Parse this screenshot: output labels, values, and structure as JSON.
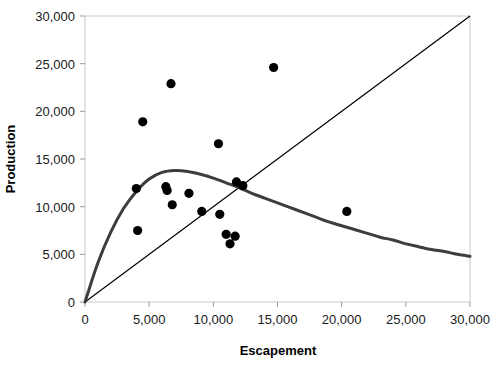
{
  "chart_data": {
    "type": "scatter",
    "title": "",
    "xlabel": "Escapement",
    "ylabel": "Production",
    "xlim": [
      0,
      30000
    ],
    "ylim": [
      0,
      30000
    ],
    "grid": false,
    "legend": "none",
    "x_ticks": [
      0,
      5000,
      10000,
      15000,
      20000,
      25000,
      30000
    ],
    "y_ticks": [
      0,
      5000,
      10000,
      15000,
      20000,
      25000,
      30000
    ],
    "x_tick_labels": [
      "0",
      "5,000",
      "10,000",
      "15,000",
      "20,000",
      "25,000",
      "30,000"
    ],
    "y_tick_labels": [
      "0",
      "5,000",
      "10,000",
      "15,000",
      "20,000",
      "25,000",
      "30,000"
    ],
    "series": [
      {
        "name": "observations",
        "type": "scatter",
        "marker": "circle",
        "color": "#000000",
        "points": [
          {
            "x": 4000,
            "y": 11900
          },
          {
            "x": 4100,
            "y": 7500
          },
          {
            "x": 4500,
            "y": 18900
          },
          {
            "x": 6300,
            "y": 12100
          },
          {
            "x": 6400,
            "y": 11700
          },
          {
            "x": 6700,
            "y": 22900
          },
          {
            "x": 6800,
            "y": 10200
          },
          {
            "x": 8100,
            "y": 11400
          },
          {
            "x": 9100,
            "y": 9500
          },
          {
            "x": 10400,
            "y": 16600
          },
          {
            "x": 10500,
            "y": 9200
          },
          {
            "x": 11000,
            "y": 7100
          },
          {
            "x": 11300,
            "y": 6100
          },
          {
            "x": 11700,
            "y": 6900
          },
          {
            "x": 11800,
            "y": 12600
          },
          {
            "x": 12300,
            "y": 12200
          },
          {
            "x": 14700,
            "y": 24600
          },
          {
            "x": 20400,
            "y": 9500
          }
        ]
      },
      {
        "name": "production-curve",
        "type": "line",
        "color": "#3d3d3d",
        "width": 3,
        "description": "Ricker stock-recruitment curve, peak 13,800 at escapement 7,000",
        "points": [
          {
            "x": 0,
            "y": 0
          },
          {
            "x": 1000,
            "y": 4100
          },
          {
            "x": 2000,
            "y": 7300
          },
          {
            "x": 3000,
            "y": 9800
          },
          {
            "x": 4000,
            "y": 11600
          },
          {
            "x": 5000,
            "y": 12900
          },
          {
            "x": 6000,
            "y": 13600
          },
          {
            "x": 7000,
            "y": 13800
          },
          {
            "x": 8000,
            "y": 13700
          },
          {
            "x": 9000,
            "y": 13400
          },
          {
            "x": 10000,
            "y": 13000
          },
          {
            "x": 11000,
            "y": 12500
          },
          {
            "x": 12000,
            "y": 12000
          },
          {
            "x": 13000,
            "y": 11400
          },
          {
            "x": 14000,
            "y": 10900
          },
          {
            "x": 15000,
            "y": 10400
          },
          {
            "x": 16000,
            "y": 9900
          },
          {
            "x": 17000,
            "y": 9400
          },
          {
            "x": 18000,
            "y": 8900
          },
          {
            "x": 19000,
            "y": 8400
          },
          {
            "x": 20000,
            "y": 8000
          },
          {
            "x": 21000,
            "y": 7600
          },
          {
            "x": 22000,
            "y": 7200
          },
          {
            "x": 23000,
            "y": 6800
          },
          {
            "x": 24000,
            "y": 6500
          },
          {
            "x": 25000,
            "y": 6100
          },
          {
            "x": 26000,
            "y": 5800
          },
          {
            "x": 27000,
            "y": 5500
          },
          {
            "x": 28000,
            "y": 5300
          },
          {
            "x": 29000,
            "y": 5000
          },
          {
            "x": 30000,
            "y": 4800
          }
        ]
      },
      {
        "name": "replacement-line",
        "type": "line",
        "color": "#000000",
        "width": 1.2,
        "description": "1:1 replacement line from origin to (30,000, 30,000)",
        "points": [
          {
            "x": 0,
            "y": 0
          },
          {
            "x": 30000,
            "y": 30000
          }
        ]
      }
    ]
  },
  "axes": {
    "plot_border_color": "#c8c8c8",
    "tick_color": "#9a9a9a"
  }
}
